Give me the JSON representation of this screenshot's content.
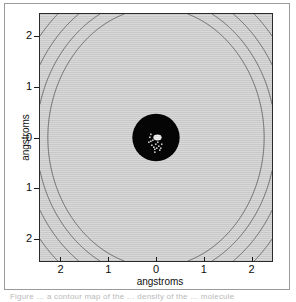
{
  "figure": {
    "caption_fragment": "Figure … a contour map of the … density of the … molecule"
  },
  "axes": {
    "xlabel": "angstroms",
    "ylabel": "angstroms",
    "x_ticklabels": [
      "2",
      "1",
      "0",
      "1",
      "2"
    ],
    "y_ticklabels": [
      "2",
      "1",
      "0",
      "1",
      "2"
    ],
    "x_tickvalues": [
      -2,
      -1,
      0,
      1,
      2
    ],
    "y_tickvalues": [
      2,
      1,
      0,
      -1,
      -2
    ],
    "background_color": "#d9d9d9",
    "frame_color": "#2b2b2b"
  },
  "colors": {
    "contour_line": "#4a4a4a",
    "saturated_core": "#050505",
    "core_highlight": "#f2f2f2",
    "plot_bg": "#d9d9d9",
    "page_bg": "#ffffff",
    "frame": "#9a9a9a"
  },
  "chart_data": {
    "type": "contour",
    "title": "",
    "xlabel": "angstroms",
    "ylabel": "angstroms",
    "xlim": [
      -2.45,
      2.45
    ],
    "ylim": [
      -2.45,
      2.45
    ],
    "xticks": [
      -2,
      -1,
      0,
      1,
      2
    ],
    "yticks": [
      -2,
      -1,
      0,
      1,
      2
    ],
    "xticklabels": [
      "2",
      "1",
      "0",
      "1",
      "2"
    ],
    "yticklabels": [
      "2",
      "1",
      "0",
      "1",
      "2"
    ],
    "grid": false,
    "legend": "none",
    "n_levels": 34,
    "core": {
      "center": [
        0,
        0
      ],
      "radius_angstrom": 0.5,
      "saturated": true
    },
    "lobes": [
      {
        "center": [
          0,
          1.1
        ],
        "type": "closed-extremum"
      },
      {
        "center": [
          0,
          -1.1
        ],
        "type": "closed-extremum"
      }
    ],
    "contour_levels": [
      0.002,
      0.004,
      0.006,
      0.008,
      0.01,
      0.013,
      0.016,
      0.02,
      0.025,
      0.03,
      0.036,
      0.043,
      0.051,
      0.06,
      0.07,
      0.082,
      0.095,
      0.11,
      0.126,
      0.144,
      0.164,
      0.186,
      0.21,
      0.237,
      0.266,
      0.298,
      0.333,
      0.371,
      0.412,
      0.457,
      0.505,
      0.557,
      0.613,
      0.673
    ]
  }
}
